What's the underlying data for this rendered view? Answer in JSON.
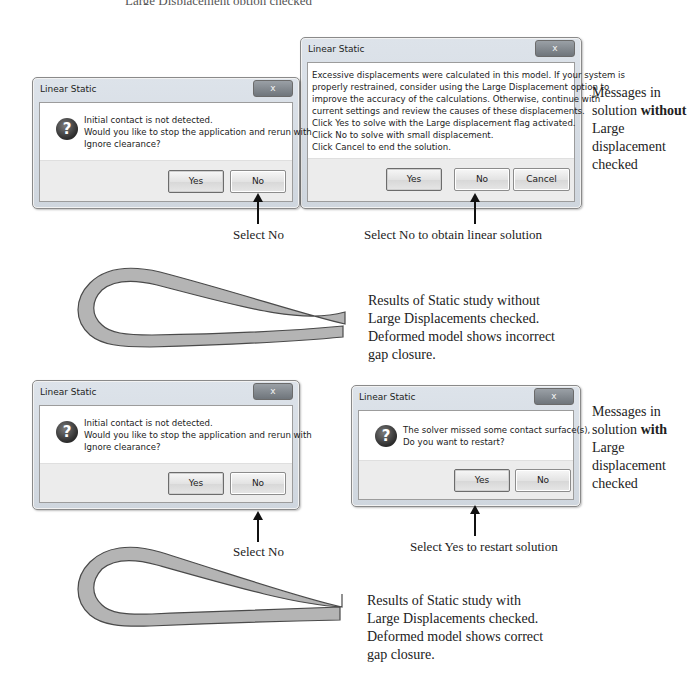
{
  "top_cut_text": "Large Displacement option checked",
  "section_without": {
    "dialog_contact": {
      "title": "Linear Static",
      "close_label": "x",
      "icon": "question-icon",
      "message_lines": [
        "Initial contact is not detected.",
        "Would you like to stop the application and rerun with",
        "Ignore clearance?"
      ],
      "buttons": {
        "yes": "Yes",
        "no": "No"
      }
    },
    "dialog_displacement": {
      "title": "Linear Static",
      "close_label": "x",
      "message_lines": [
        "Excessive displacements were calculated in this model. If your system is",
        "properly restrained, consider using the Large Displacement option to",
        "improve the accuracy of the calculations.  Otherwise, continue with",
        "current settings and review the causes of these displacements.",
        "Click Yes to solve with the Large displacement flag activated.",
        "Click No to solve with small displacement.",
        "Click Cancel to end the solution."
      ],
      "buttons": {
        "yes": "Yes",
        "no": "No",
        "cancel": "Cancel"
      }
    },
    "caption_left": "Select No",
    "caption_right": "Select No to obtain linear solution",
    "side_note": {
      "pre": "Messages in solution",
      "bold": "without",
      "post": "Large displacement checked"
    },
    "result_lines": [
      "Results of Static study without",
      "Large Displacements checked.",
      "Deformed model shows incorrect",
      "gap closure."
    ]
  },
  "section_with": {
    "dialog_contact": {
      "title": "Linear Static",
      "close_label": "x",
      "icon": "question-icon",
      "message_lines": [
        "Initial contact is not detected.",
        "Would you like to stop the application and rerun with",
        "Ignore clearance?"
      ],
      "buttons": {
        "yes": "Yes",
        "no": "No"
      }
    },
    "dialog_restart": {
      "title": "Linear Static",
      "close_label": "x",
      "icon": "question-icon",
      "message_lines": [
        "The solver missed some contact surface(s),",
        "Do you want to restart?"
      ],
      "buttons": {
        "yes": "Yes",
        "no": "No"
      }
    },
    "caption_left": "Select No",
    "caption_right": "Select Yes to restart solution",
    "side_note": {
      "pre": "Messages in solution",
      "bold": "with",
      "post": "Large displacement checked"
    },
    "result_lines": [
      "Results of Static study with",
      "Large Displacements checked.",
      "Deformed model shows correct",
      "gap closure."
    ]
  },
  "colors": {
    "model_fill": "#b4b4b4",
    "model_stroke": "#4a4a4a",
    "dialog_frame": "#d6dce3",
    "button_area": "#ececec"
  }
}
